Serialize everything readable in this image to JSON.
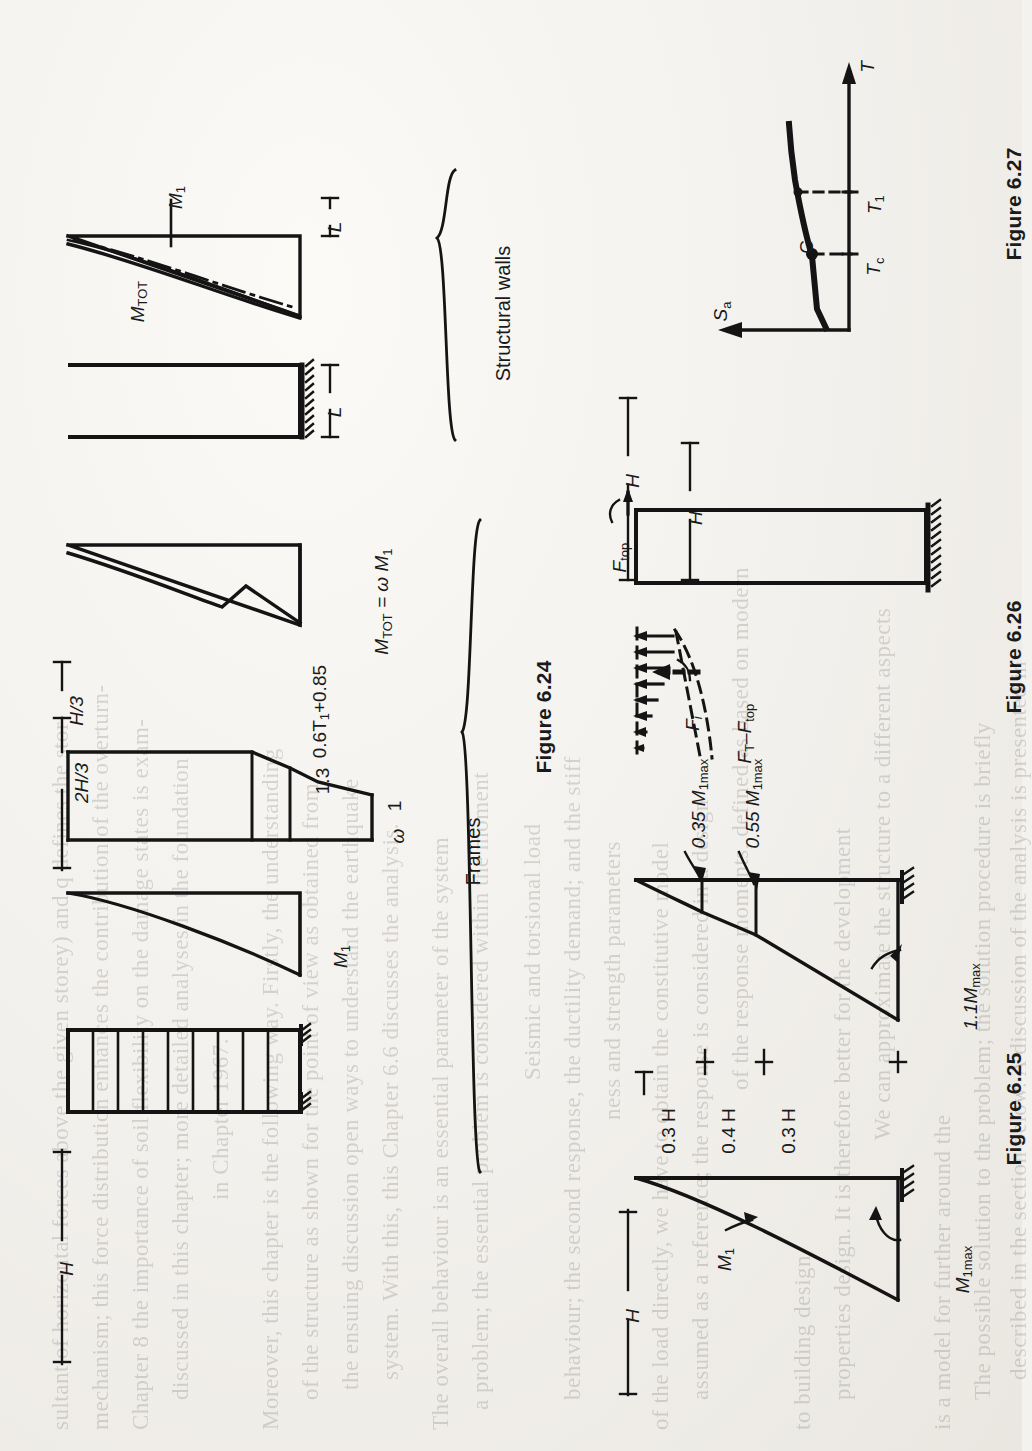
{
  "page": {
    "background_color": "#f2f0ec",
    "ink_color": "#1a1a1a",
    "orientation_note": "page content rotated 90 degrees clockwise"
  },
  "group_labels": {
    "structural_walls": "Structural walls",
    "frames": "Frames"
  },
  "figures": [
    {
      "id": "fig-6-24",
      "caption": "Figure 6.24",
      "labels": {
        "wall_mtot": "M",
        "wall_mtot_sub": "TOT",
        "wall_m1": "M",
        "wall_m1_sub": "1",
        "wall_dim_L": "L",
        "wall_dim_L2": "L",
        "frame_H": "H",
        "frame_m1": "M",
        "frame_m1_sub": "1",
        "frame_2h3": "2H/3",
        "frame_h3": "H/3",
        "omega_top": "0.6T",
        "omega_top_sub": "1",
        "omega_top_tail": "+0.85",
        "omega_mid": "1.3",
        "omega_low": "1",
        "omega_sym": "ω",
        "frame_mtot": "M",
        "frame_mtot_sub": "TOT",
        "frame_mtot_eq": " = ω M",
        "frame_mtot_eq_sub": "1"
      }
    },
    {
      "id": "fig-6-25",
      "caption": "Figure 6.25",
      "labels": {
        "H_lower": "H",
        "m1_curve": "M",
        "m1_curve_sub": "1",
        "m1max": "M",
        "m1max_sub": "1max",
        "seg_03H_top": "0.3 H",
        "seg_04H": "0.4 H",
        "seg_03H_bot": "0.3 H",
        "lab_035": "0.35 M",
        "lab_035_sub": "1max",
        "lab_055": "0.55 M",
        "lab_055_sub": "1max",
        "lab_11": "1.1M",
        "lab_11_sub": "max"
      }
    },
    {
      "id": "fig-6-26",
      "caption": "Figure 6.26",
      "labels": {
        "H": "H",
        "Hi": "H",
        "Hi_sub": "i",
        "F_top": "F",
        "F_top_sub": "top",
        "F_i": "F",
        "F_i_sub": "i",
        "F_T_minus_F_top": "F",
        "F_T_sub": "T",
        "F_T_dash": "–F",
        "F_T_tail_sub": "top"
      }
    },
    {
      "id": "fig-6-27",
      "caption": "Figure 6.27",
      "labels": {
        "axis_T": "T",
        "axis_Sa": "S",
        "axis_Sa_sub": "a",
        "point_C": "C",
        "tick_Tc": "T",
        "tick_Tc_sub": "c",
        "tick_T1": "T",
        "tick_T1_sub": "1"
      }
    }
  ],
  "ghost_text": {
    "lines": [
      "sultant of horizontal forces above the given storey) and q defines the stor-",
      "mechanism; this force distribution enhances the contribution of the overturn-",
      "Chapter 8 the importance of soil flexibility on the damage states is exam-",
      "discussed in this chapter; more detailed analyses in the foundation",
      "in Chapter 1967.",
      "Moreover, this chapter is the following way. Firstly, the understanding",
      "of the structure as shown for the point of view as obtained from",
      "the ensuing discussion open ways to understand the earthquake",
      "system. With this, this Chapter 6.6 discusses the analysis.",
      "The overall behaviour is an essential parameter of the system",
      "a problem; the essential problem is considered within the moment",
      "Seismic and torsional load",
      "behaviour; the second response, the ductility demand; and the stiff",
      "ness and strength parameters",
      "of the load directly, we have to obtain the constitutive model",
      "assumed as a reference; the response is considered in a design",
      "of the response moments, defined as based on modern",
      "to building design",
      "properties design. It is therefore better for the development",
      "We can approximate the structure to a different aspects",
      "is a model for further around the",
      "The possible solution to the problem; the solution procedure is briefly",
      "described in the section below. A discussion of the analysis is presented in",
      "the next section",
      "tions, we should make a review of the literature in a general way",
      "and briefly represented in the first section of this chapter"
    ]
  }
}
